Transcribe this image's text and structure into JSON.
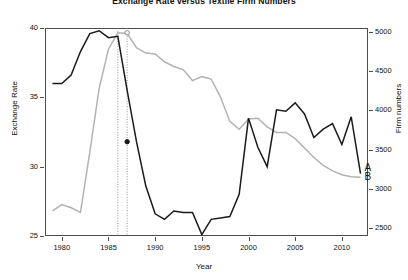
{
  "chart_data": {
    "type": "line",
    "title": "Exchange Rate versus Textile Firm Numbers",
    "xlabel": "Year",
    "ylabel": "Exchange Rate",
    "ylabel_right": "Firm numbers",
    "xlim": [
      1978.2,
      2012.8
    ],
    "ylim": [
      25,
      40
    ],
    "ylim_right": [
      2400,
      5050
    ],
    "grid": false,
    "legend": "inline-end-labels",
    "yticks": [
      25,
      30,
      35,
      40
    ],
    "yticks_right": [
      2500,
      3000,
      3500,
      4000,
      4500,
      5000
    ],
    "xticks": [
      1980,
      1985,
      1990,
      1995,
      2000,
      2005,
      2010
    ],
    "ytick_labels": [
      "25",
      "30",
      "35",
      "40"
    ],
    "ytick_right_labels": [
      "2500",
      "3000",
      "3500",
      "4000",
      "4500",
      "5000"
    ],
    "xtick_labels": [
      "1980",
      "1985",
      "1990",
      "1995",
      "2000",
      "2005",
      "2010"
    ],
    "annotations": {
      "vlines": [
        1986,
        1987
      ],
      "vline_style": "dotted",
      "points": [
        {
          "series": "A",
          "x": 1987,
          "y": 31.8,
          "marker": "filled-circle"
        },
        {
          "series": "B",
          "x": 1987,
          "y": 4990,
          "marker": "open-circle"
        }
      ]
    },
    "series": [
      {
        "name": "A",
        "label": "A",
        "axis": "left",
        "color": "#1a1a1a",
        "x": [
          1979,
          1980,
          1981,
          1982,
          1983,
          1984,
          1985,
          1986,
          1987,
          1988,
          1989,
          1990,
          1991,
          1992,
          1993,
          1994,
          1995,
          1996,
          1997,
          1998,
          1999,
          2000,
          2001,
          2002,
          2003,
          2004,
          2005,
          2006,
          2007,
          2008,
          2009,
          2010,
          2011,
          2012
        ],
        "y": [
          36.0,
          36.0,
          36.6,
          38.3,
          39.6,
          39.8,
          39.3,
          39.4,
          35.5,
          31.8,
          28.6,
          26.6,
          26.2,
          26.8,
          26.7,
          26.7,
          25.1,
          26.2,
          26.3,
          26.4,
          28.0,
          33.5,
          31.4,
          30.0,
          34.1,
          34.0,
          34.6,
          33.8,
          32.1,
          32.7,
          33.1,
          31.6,
          33.6,
          29.5
        ]
      },
      {
        "name": "B",
        "label": "B",
        "axis": "right",
        "color": "#b3b3b3",
        "x": [
          1979,
          1980,
          1981,
          1982,
          1983,
          1984,
          1985,
          1986,
          1987,
          1988,
          1989,
          1990,
          1991,
          1992,
          1993,
          1994,
          1995,
          1996,
          1997,
          1998,
          1999,
          2000,
          2001,
          2002,
          2003,
          2004,
          2005,
          2006,
          2007,
          2008,
          2009,
          2010,
          2011,
          2012
        ],
        "y": [
          2720,
          2800,
          2760,
          2700,
          3470,
          4280,
          4780,
          4990,
          4980,
          4800,
          4730,
          4720,
          4620,
          4560,
          4520,
          4380,
          4430,
          4400,
          4170,
          3860,
          3760,
          3890,
          3900,
          3790,
          3720,
          3720,
          3640,
          3520,
          3400,
          3300,
          3230,
          3180,
          3155,
          3150
        ]
      }
    ]
  }
}
